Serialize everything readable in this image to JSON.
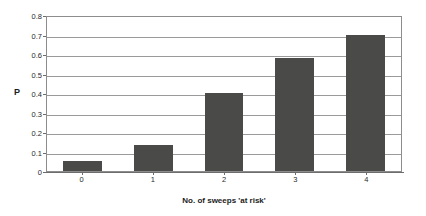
{
  "chart_data": {
    "type": "bar",
    "title": "",
    "categories": [
      "0",
      "1",
      "2",
      "3",
      "4"
    ],
    "values": [
      0.05,
      0.135,
      0.4,
      0.58,
      0.7
    ],
    "series": [
      {
        "name": "P",
        "values": [
          0.05,
          0.135,
          0.4,
          0.58,
          0.7
        ]
      }
    ],
    "xlabel": "No. of sweeps 'at risk'",
    "ylabel": "P",
    "ylim": [
      0,
      0.8
    ],
    "ytick_labels": [
      "0.8",
      "0.7",
      "0.6",
      "0.5",
      "0.4",
      "0.3",
      "0.2",
      "0.1",
      "0"
    ],
    "ytick_values": [
      0.8,
      0.7,
      0.6,
      0.5,
      0.4,
      0.3,
      0.2,
      0.1,
      0
    ],
    "grid": true,
    "grid_axis": "y",
    "legend": false,
    "legend_position": "none",
    "bar_color": "#4a4a48",
    "plot_border_color": "#8d8d8d",
    "gridline_color": "#9a9a9a",
    "background_color": "#ffffff"
  }
}
